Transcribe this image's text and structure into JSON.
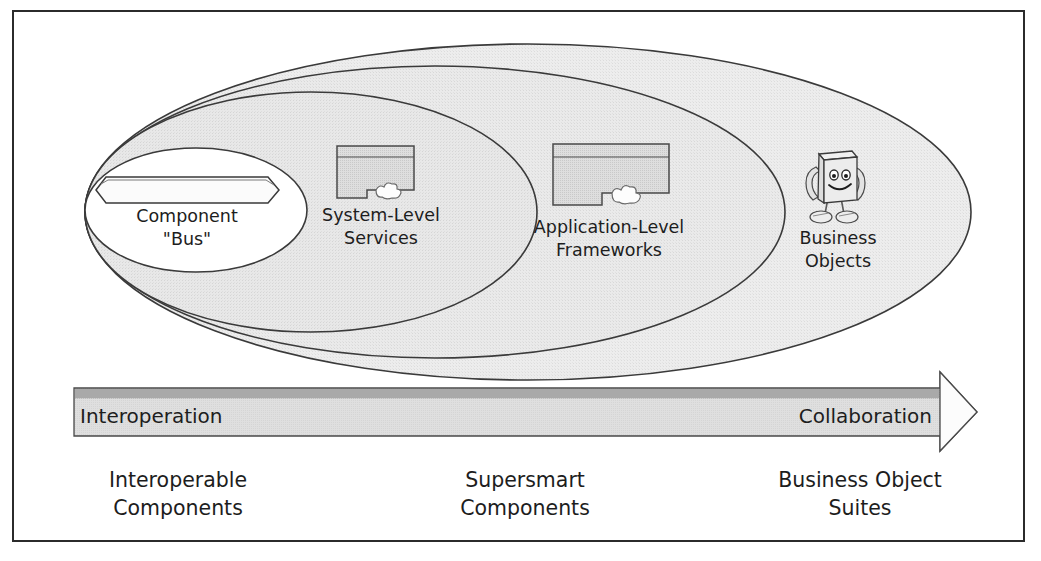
{
  "diagram": {
    "frame": {
      "border_color": "#2b2b2b"
    },
    "palette": {
      "fill_outer": "#ebebeb",
      "fill_mid_outer": "#e6e6e6",
      "fill_mid_inner": "#e2e2e2",
      "fill_inner": "#ffffff",
      "stroke": "#3a3a3a",
      "bar_fill": "#c9c9c9",
      "bar_top_strip": "#a8a8a8",
      "bar_bottom_fill": "#efefef",
      "icon_fill": "#d6d6d6",
      "text": "#1d1d1d"
    },
    "layers": [
      {
        "id": "component-bus",
        "label_line1": "Component",
        "label_line2": "\"Bus\"",
        "icon": "bus-bar-icon"
      },
      {
        "id": "system-level-services",
        "label_line1": "System-Level",
        "label_line2": "Services",
        "icon": "l-block-puzzle-icon"
      },
      {
        "id": "application-level-frameworks",
        "label_line1": "Application-Level",
        "label_line2": "Frameworks",
        "icon": "l-block-puzzle-icon"
      },
      {
        "id": "business-objects",
        "label_line1": "Business",
        "label_line2": "Objects",
        "icon": "cube-character-icon"
      }
    ],
    "arrow": {
      "left_label": "Interoperation",
      "right_label": "Collaboration",
      "direction": "right"
    },
    "stages": [
      {
        "id": "interoperable-components",
        "line1": "Interoperable",
        "line2": "Components"
      },
      {
        "id": "supersmart-components",
        "line1": "Supersmart",
        "line2": "Components"
      },
      {
        "id": "business-object-suites",
        "line1": "Business Object",
        "line2": "Suites"
      }
    ]
  }
}
